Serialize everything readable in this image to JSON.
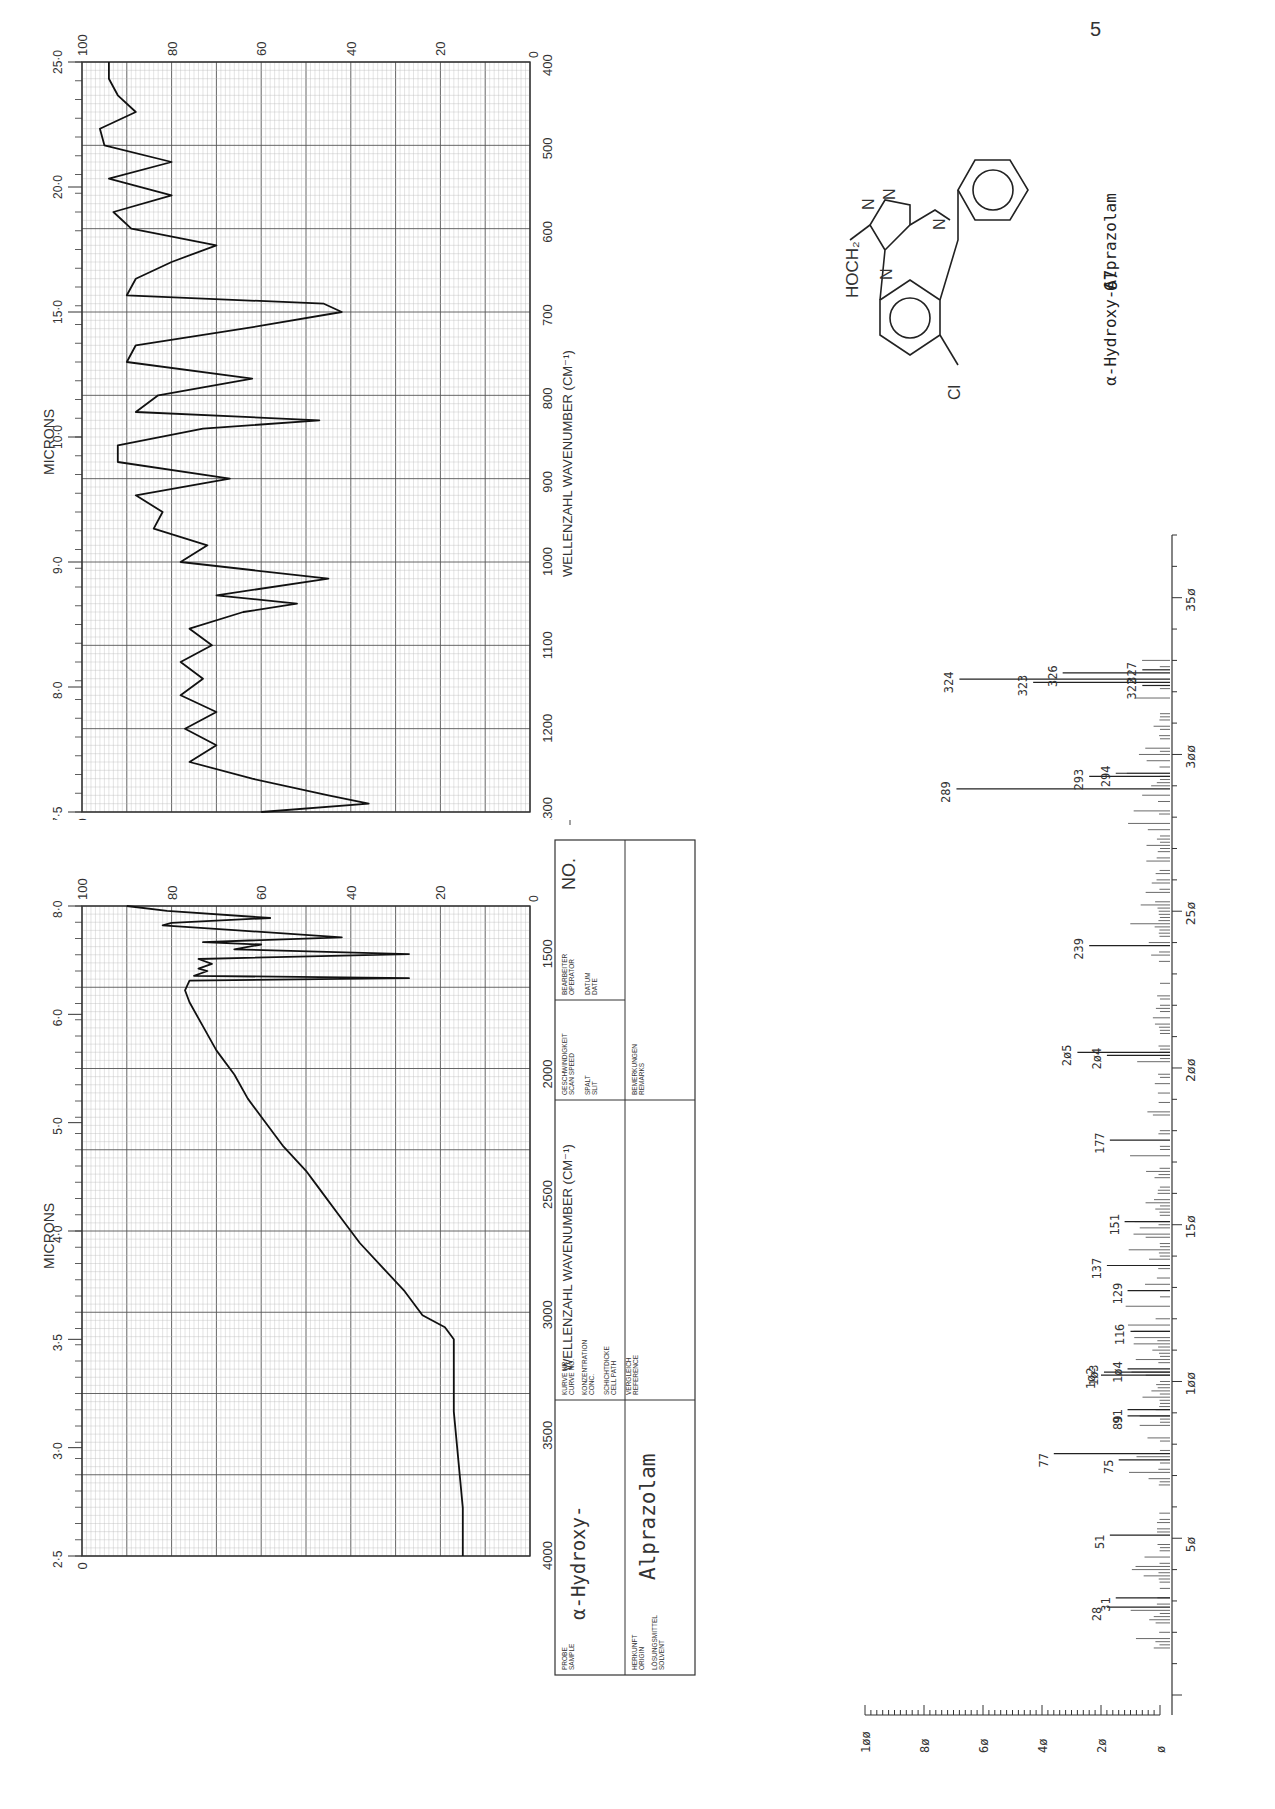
{
  "page": {
    "page_number_fragment": "5",
    "compound_number": "67",
    "compound_name": "α-Hydroxy-Alprazolam"
  },
  "structure": {
    "substituents": [
      "HOCH2",
      "Cl"
    ],
    "ring_atoms": [
      "N",
      "N",
      "N",
      "N"
    ],
    "description": "triazolobenzodiazepine with phenyl ring"
  },
  "ir_form": {
    "no_label": "NO.",
    "probe_label": "PROBE\nSAMPLE",
    "probe_value_line1": "α-Hydroxy-",
    "probe_value_line2": "Alprazolam",
    "herkunft_label": "HERKUNFT ORIGIN",
    "solvent_label": "LÖSUNGSMITTEL SOLVENT",
    "kurve_label": "KURVE NR. CURVE NO.",
    "konz_label": "KONZENTRATION CONC.",
    "schicht_label": "SCHICHTDICKE CELL PATH",
    "vergleich_label": "VERGLEICH REFERENCE",
    "speed_label": "GESCHWINDIGKEIT SCAN SPEED",
    "spalt_label": "SPALT SLIT",
    "bemerk_label": "BEMERKUNGEN REMARKS",
    "bearbeiter_label": "BEARBEITER OPERATOR",
    "datum_label": "DATUM DATE"
  },
  "chart_data": [
    {
      "type": "line",
      "title": "IR spectrum (high wavenumber) – α-Hydroxy-Alprazolam",
      "xlabel": "WELLENZAHL  WAVENUMBER (CM⁻¹)",
      "ylabel": "DURCHLÄSSIGKEIT  TRANSMITTANCE (%)",
      "x2label": "MICRONS",
      "xlim": [
        4000,
        1300
      ],
      "ylim": [
        0,
        100
      ],
      "x_ticks": [
        4000,
        3500,
        3000,
        2500,
        2000,
        1500
      ],
      "micron_ticks": [
        "2·5",
        "3·0",
        "3·5",
        "4·0",
        "5·0",
        "6·0",
        "8·0"
      ],
      "y_ticks": [
        0,
        20,
        40,
        60,
        80,
        100
      ],
      "grid": true,
      "x": [
        4000,
        3800,
        3600,
        3400,
        3200,
        3100,
        3050,
        3000,
        2900,
        2800,
        2700,
        2600,
        2500,
        2450,
        2400,
        2300,
        2200,
        2100,
        2000,
        1900,
        1800,
        1700,
        1650,
        1610,
        1600,
        1590,
        1570,
        1560,
        1540,
        1520,
        1500,
        1480,
        1460,
        1450,
        1430,
        1400,
        1380,
        1370,
        1350,
        1320,
        1300
      ],
      "y": [
        15,
        15,
        16,
        17,
        17,
        17,
        19,
        24,
        28,
        33,
        38,
        42,
        46,
        48,
        50,
        55,
        59,
        63,
        66,
        70,
        73,
        76,
        77,
        76,
        27,
        75,
        72,
        74,
        71,
        74,
        27,
        66,
        60,
        73,
        42,
        66,
        82,
        80,
        58,
        81,
        90
      ]
    },
    {
      "type": "line",
      "title": "IR spectrum (low wavenumber) – α-Hydroxy-Alprazolam",
      "xlabel": "WELLENZAHL  WAVENUMBER (CM⁻¹)",
      "ylabel": "DURCHLÄSSIGKEIT  TRANSMITTANCE (%)",
      "x2label": "MICRONS",
      "xlim": [
        1300,
        400
      ],
      "ylim": [
        0,
        100
      ],
      "x_ticks": [
        1300,
        1200,
        1100,
        1000,
        900,
        800,
        700,
        600,
        500,
        400
      ],
      "micron_ticks": [
        "7·5",
        "8·0",
        "9·0",
        "10·0",
        "15·0",
        "20·0",
        "25·0"
      ],
      "y_ticks": [
        0,
        20,
        40,
        60,
        80,
        100
      ],
      "grid": true,
      "x": [
        1300,
        1290,
        1280,
        1260,
        1240,
        1220,
        1200,
        1180,
        1160,
        1140,
        1120,
        1100,
        1080,
        1060,
        1050,
        1040,
        1020,
        1000,
        980,
        960,
        940,
        920,
        900,
        880,
        860,
        840,
        830,
        820,
        800,
        780,
        760,
        740,
        720,
        700,
        690,
        680,
        660,
        640,
        620,
        600,
        580,
        560,
        540,
        520,
        500,
        480,
        460,
        440,
        420,
        400
      ],
      "y": [
        60,
        36,
        45,
        62,
        76,
        70,
        77,
        70,
        78,
        73,
        78,
        71,
        76,
        64,
        52,
        70,
        45,
        78,
        72,
        84,
        82,
        88,
        67,
        92,
        92,
        73,
        47,
        88,
        83,
        62,
        90,
        88,
        64,
        42,
        46,
        90,
        88,
        80,
        70,
        89,
        93,
        80,
        94,
        80,
        95,
        96,
        88,
        92,
        94,
        94
      ]
    },
    {
      "type": "bar",
      "title": "Mass spectrum – α-Hydroxy-Alprazolam",
      "xlabel": "m/z",
      "ylabel": "Relative intensity (%)",
      "xlim": [
        0,
        370
      ],
      "ylim": [
        0,
        100
      ],
      "x_ticks": [
        50,
        100,
        150,
        200,
        250,
        300,
        350
      ],
      "y_ticks": [
        0,
        20,
        40,
        60,
        80,
        100
      ],
      "labeled_peaks": [
        {
          "mz": 28,
          "intensity": 18
        },
        {
          "mz": 31,
          "intensity": 15
        },
        {
          "mz": 51,
          "intensity": 17
        },
        {
          "mz": 75,
          "intensity": 14
        },
        {
          "mz": 77,
          "intensity": 36
        },
        {
          "mz": 89,
          "intensity": 11
        },
        {
          "mz": 91,
          "intensity": 11
        },
        {
          "mz": 102,
          "intensity": 20
        },
        {
          "mz": 103,
          "intensity": 19
        },
        {
          "mz": 104,
          "intensity": 11
        },
        {
          "mz": 116,
          "intensity": 10
        },
        {
          "mz": 129,
          "intensity": 11
        },
        {
          "mz": 137,
          "intensity": 18
        },
        {
          "mz": 151,
          "intensity": 12
        },
        {
          "mz": 177,
          "intensity": 17
        },
        {
          "mz": 204,
          "intensity": 18
        },
        {
          "mz": 205,
          "intensity": 28
        },
        {
          "mz": 239,
          "intensity": 24
        },
        {
          "mz": 289,
          "intensity": 69
        },
        {
          "mz": 293,
          "intensity": 24
        },
        {
          "mz": 294,
          "intensity": 15
        },
        {
          "mz": 322,
          "intensity": 6
        },
        {
          "mz": 323,
          "intensity": 43
        },
        {
          "mz": 324,
          "intensity": 68
        },
        {
          "mz": 326,
          "intensity": 33
        },
        {
          "mz": 327,
          "intensity": 6
        }
      ],
      "base_peak_offscale": "289/324 lines extend to top of frame"
    }
  ]
}
